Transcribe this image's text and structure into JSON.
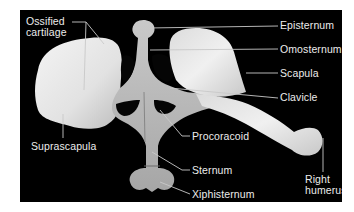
{
  "figure": {
    "background_color": "#000000",
    "bone_color": "#e8e8e8",
    "cartilage_color": "#b8b8b8",
    "label_color": "#ececec",
    "leader_line_color": "#c8c8c8"
  },
  "labels": {
    "ossified_cartilage_line1": "Ossified",
    "ossified_cartilage_line2": "cartilage",
    "episternum": "Episternum",
    "omosternum": "Omosternum",
    "scapula": "Scapula",
    "clavicle": "Clavicle",
    "procoracoid": "Procoracoid",
    "suprascapula": "Suprascapula",
    "sternum": "Sternum",
    "xiphisternum": "Xiphisternum",
    "right_humerus_line1": "Right",
    "right_humerus_line2": "humerus"
  }
}
